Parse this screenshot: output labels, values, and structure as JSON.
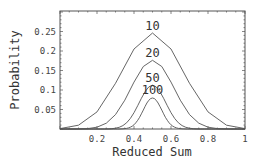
{
  "chart_data": {
    "type": "line",
    "title": "",
    "xlabel": "Reduced Sum",
    "ylabel": "Probability",
    "xlim": [
      0,
      1
    ],
    "ylim": [
      0,
      0.3
    ],
    "x_ticks": [
      "0.2",
      "0.4",
      "0.6",
      "0.8",
      "1"
    ],
    "y_ticks": [
      "0.05",
      "0.1",
      "0.15",
      "0.2",
      "0.25"
    ],
    "grid": false,
    "legend": "inline labels above peaks",
    "series": [
      {
        "name": "10",
        "n": 10,
        "values": [
          0.001,
          0.0098,
          0.0439,
          0.1172,
          0.2051,
          0.2461,
          0.2051,
          0.1172,
          0.0439,
          0.0098,
          0.001
        ]
      },
      {
        "name": "20",
        "n": 20,
        "values": [
          1e-06,
          1.9e-05,
          0.000181,
          0.001087,
          0.004621,
          0.014786,
          0.036964,
          0.073929,
          0.120134,
          0.160179,
          0.176197,
          0.160179,
          0.120134,
          0.073929,
          0.036964,
          0.014786,
          0.004621,
          0.001087,
          0.000181,
          1.9e-05,
          1e-06
        ]
      },
      {
        "name": "50",
        "n": 50,
        "values": [
          0,
          0,
          0,
          0,
          0,
          0,
          0,
          0,
          0,
          0,
          1e-05,
          4e-05,
          0.00012,
          0.00034,
          0.00083,
          0.002,
          0.0044,
          0.0087,
          0.016,
          0.027,
          0.0419,
          0.0598,
          0.0788,
          0.096,
          0.108,
          0.1123,
          0.108,
          0.096,
          0.0788,
          0.0598,
          0.0419,
          0.027,
          0.016,
          0.0087,
          0.0044,
          0.002,
          0.00083,
          0.00034,
          0.00012,
          4e-05,
          1e-05,
          0,
          0,
          0,
          0,
          0,
          0,
          0,
          0,
          0,
          0
        ]
      },
      {
        "name": "100",
        "n": 100,
        "values": [
          0,
          0,
          0,
          0,
          0,
          0,
          0,
          0,
          0,
          0,
          0,
          0,
          0,
          0,
          0,
          0,
          0,
          0,
          0,
          0,
          0,
          0,
          0,
          0,
          0,
          0,
          0,
          0,
          0,
          0,
          0,
          0,
          0.0001,
          0.0002,
          0.0005,
          0.0009,
          0.0016,
          0.0027,
          0.0045,
          0.0071,
          0.0108,
          0.0159,
          0.0223,
          0.0301,
          0.039,
          0.0485,
          0.058,
          0.0666,
          0.0735,
          0.078,
          0.0796,
          0.078,
          0.0735,
          0.0666,
          0.058,
          0.0485,
          0.039,
          0.0301,
          0.0223,
          0.0159,
          0.0108,
          0.0071,
          0.0045,
          0.0027,
          0.0016,
          0.0009,
          0.0005,
          0.0002,
          0.0001,
          0,
          0,
          0,
          0,
          0,
          0,
          0,
          0,
          0,
          0,
          0,
          0,
          0,
          0,
          0,
          0,
          0,
          0,
          0,
          0,
          0,
          0,
          0,
          0,
          0,
          0,
          0,
          0,
          0,
          0,
          0,
          0
        ]
      }
    ],
    "annotations": [
      {
        "text": "10",
        "x": 0.5,
        "y": 0.265
      },
      {
        "text": "20",
        "x": 0.5,
        "y": 0.195
      },
      {
        "text": "50",
        "x": 0.5,
        "y": 0.13
      },
      {
        "text": "100",
        "x": 0.5,
        "y": 0.1
      }
    ]
  }
}
